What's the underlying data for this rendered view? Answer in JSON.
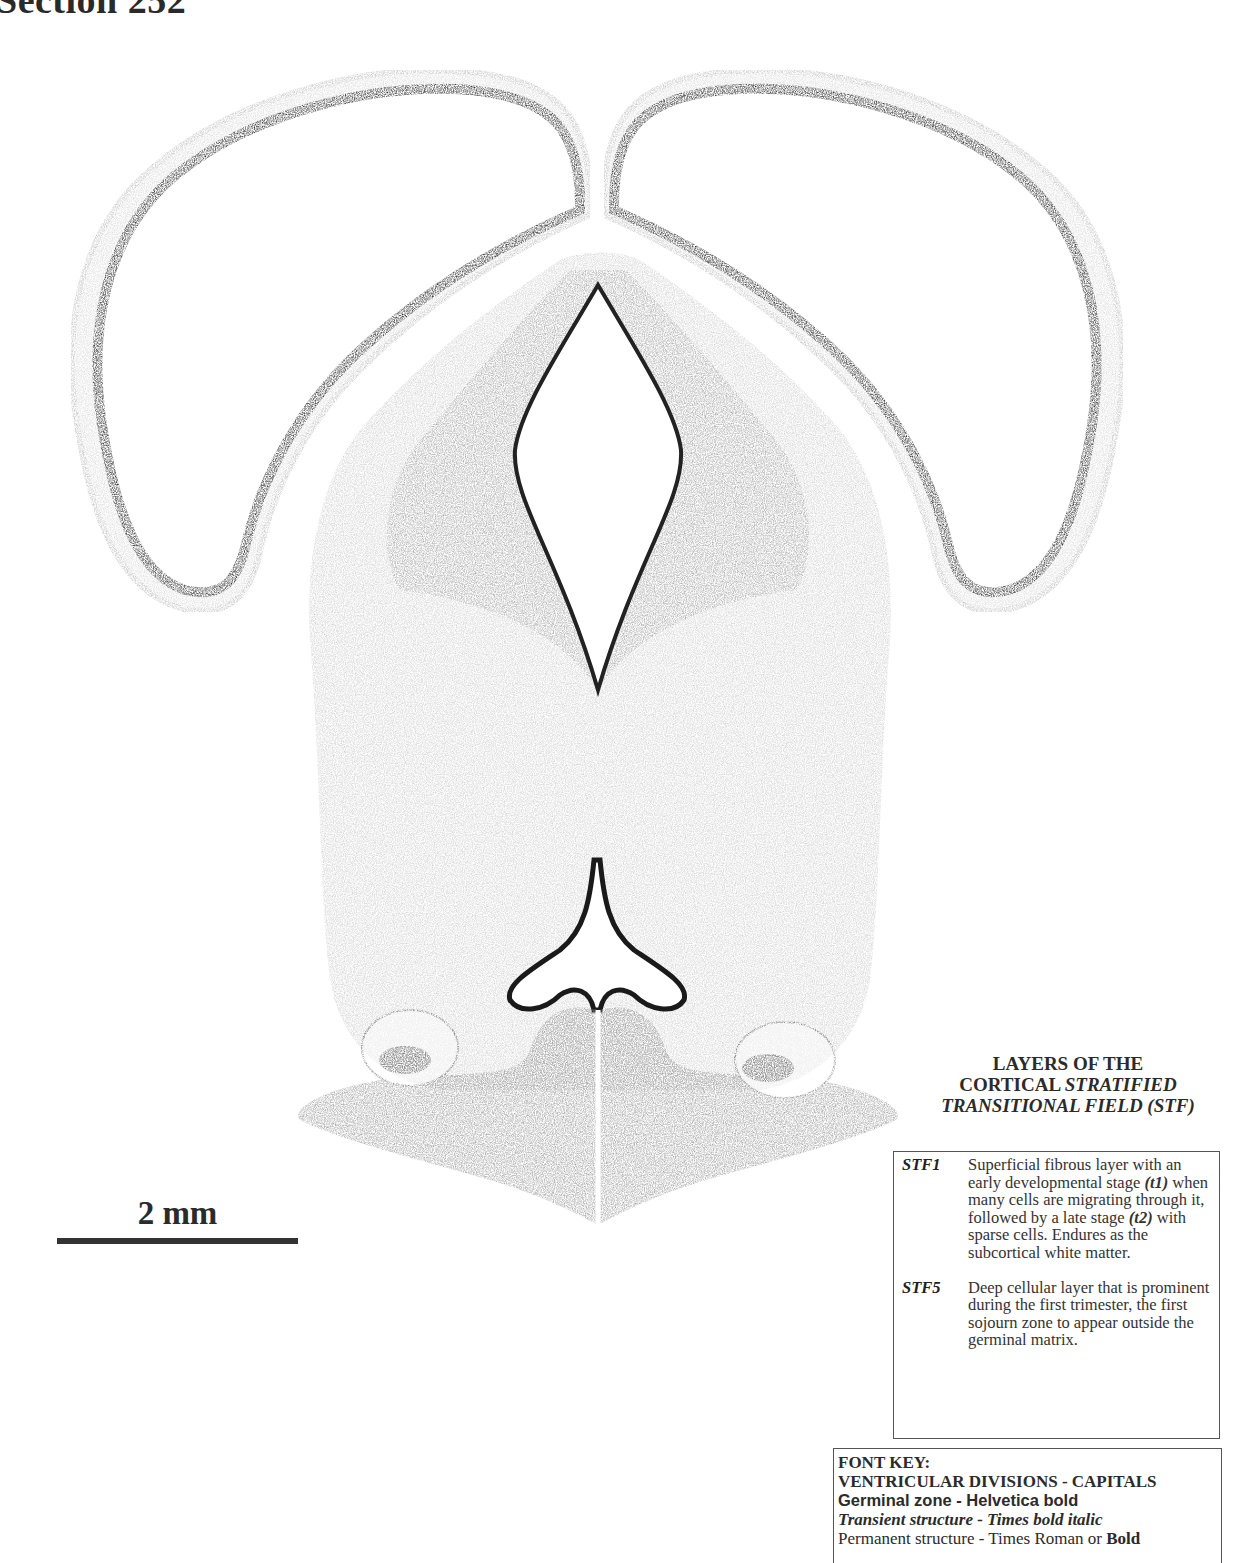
{
  "header": {
    "title": "Section 252"
  },
  "figure": {
    "type": "histological coronal section"
  },
  "scale_bar": {
    "label": "2 mm"
  },
  "stf_legend": {
    "title_line1": "LAYERS OF THE",
    "title_line2_plain": "CORTICAL ",
    "title_line2_italic": "STRATIFIED",
    "title_line3": "TRANSITIONAL FIELD (STF)",
    "items": [
      {
        "code": "STF1",
        "text_a": "Superficial fibrous layer with an early developmental stage ",
        "t1": "(t1)",
        "text_b": " when many cells are migrating through it, followed by a late stage ",
        "t2": "(t2)",
        "text_c": " with sparse cells.  Endures as the subcortical white matter."
      },
      {
        "code": "STF5",
        "text": "Deep cellular layer that is prominent during the first trimester, the first sojourn zone to appear outside the germinal matrix."
      }
    ]
  },
  "font_key": {
    "heading": "FONT KEY:",
    "ventricular": "VENTRICULAR DIVISIONS - CAPITALS",
    "germinal": "Germinal zone - Helvetica bold",
    "transient": "Transient structure - Times bold italic",
    "permanent_plain": "Permanent structure - Times Roman or ",
    "permanent_bold": "Bold"
  }
}
